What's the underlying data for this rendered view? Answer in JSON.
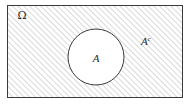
{
  "figure": {
    "type": "venn-diagram",
    "caption": "",
    "background_color": "#ffffff"
  },
  "universe": {
    "name": "universe-rectangle",
    "label": "Ω",
    "border_color": "#3a3a3a",
    "fill_description": "diagonal-hatch",
    "hatch_color": "#b9b9b9",
    "hatch_angle_deg": 45,
    "hatch_spacing_px": 4,
    "x": 7,
    "y": 5,
    "width": 175,
    "height": 92
  },
  "set_a": {
    "name": "set-a-circle",
    "label": "A",
    "border_color": "#3a3a3a",
    "fill_color": "#ffffff",
    "center_x": 96,
    "center_y": 57,
    "radius": 28
  },
  "complement": {
    "name": "complement-label",
    "base": "A",
    "superscript": "c",
    "x": 146,
    "y": 45
  },
  "labels": {
    "omega_x": 22,
    "omega_y": 19,
    "a_x": 96,
    "a_y": 62
  }
}
